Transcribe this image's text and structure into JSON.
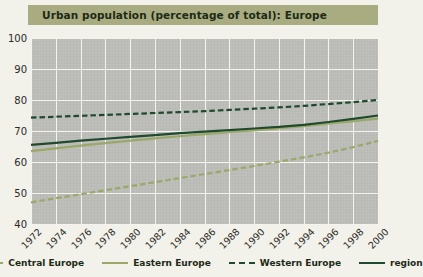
{
  "title": "Urban population (percentage of total): Europe",
  "colors": {
    "title_bar": "#a9ac80",
    "plot_bg": "#bcbcb8",
    "grid": "#f4f3ee",
    "light_green": "#9aa86a",
    "dark_green": "#1f4a2e",
    "page_bg": "#f2f1ea"
  },
  "legend": [
    {
      "label": "Central Europe",
      "style": "dashed",
      "color": "#9aa86a"
    },
    {
      "label": "Eastern Europe",
      "style": "solid",
      "color": "#9aa86a"
    },
    {
      "label": "Western Europe",
      "style": "dashed",
      "color": "#1f4a2e"
    },
    {
      "label": "region",
      "style": "solid",
      "color": "#1f4a2e"
    }
  ],
  "chart_data": {
    "type": "line",
    "title": "Urban population (percentage of total): Europe",
    "xlabel": "",
    "ylabel": "",
    "ylim": [
      40,
      100
    ],
    "yticks": [
      40,
      50,
      60,
      70,
      80,
      90,
      100
    ],
    "grid": true,
    "legend_position": "bottom",
    "x": [
      1972,
      1974,
      1976,
      1978,
      1980,
      1982,
      1984,
      1986,
      1988,
      1990,
      1992,
      1994,
      1996,
      1998,
      2000
    ],
    "categories": [
      "1972",
      "1974",
      "1976",
      "1978",
      "1980",
      "1982",
      "1984",
      "1986",
      "1988",
      "1990",
      "1992",
      "1994",
      "1996",
      "1998",
      "2000"
    ],
    "series": [
      {
        "name": "Central Europe",
        "style": "dashed",
        "color": "#9aa86a",
        "values": [
          47.0,
          48.3,
          49.6,
          50.9,
          52.2,
          53.5,
          54.8,
          56.1,
          57.4,
          58.7,
          60.1,
          61.5,
          63.0,
          64.8,
          66.8
        ]
      },
      {
        "name": "Eastern Europe",
        "style": "solid",
        "color": "#9aa86a",
        "values": [
          63.5,
          64.4,
          65.3,
          66.1,
          66.9,
          67.6,
          68.3,
          69.0,
          69.6,
          70.2,
          70.8,
          71.6,
          72.4,
          73.2,
          74.0
        ]
      },
      {
        "name": "Western Europe",
        "style": "dashed",
        "color": "#1f4a2e",
        "values": [
          74.3,
          74.6,
          74.9,
          75.2,
          75.5,
          75.8,
          76.1,
          76.4,
          76.8,
          77.2,
          77.6,
          78.1,
          78.7,
          79.3,
          80.0
        ]
      },
      {
        "name": "region",
        "style": "solid",
        "color": "#1f4a2e",
        "values": [
          65.5,
          66.2,
          66.9,
          67.5,
          68.1,
          68.7,
          69.3,
          69.8,
          70.3,
          70.8,
          71.3,
          72.0,
          72.9,
          73.9,
          75.0
        ]
      }
    ]
  }
}
